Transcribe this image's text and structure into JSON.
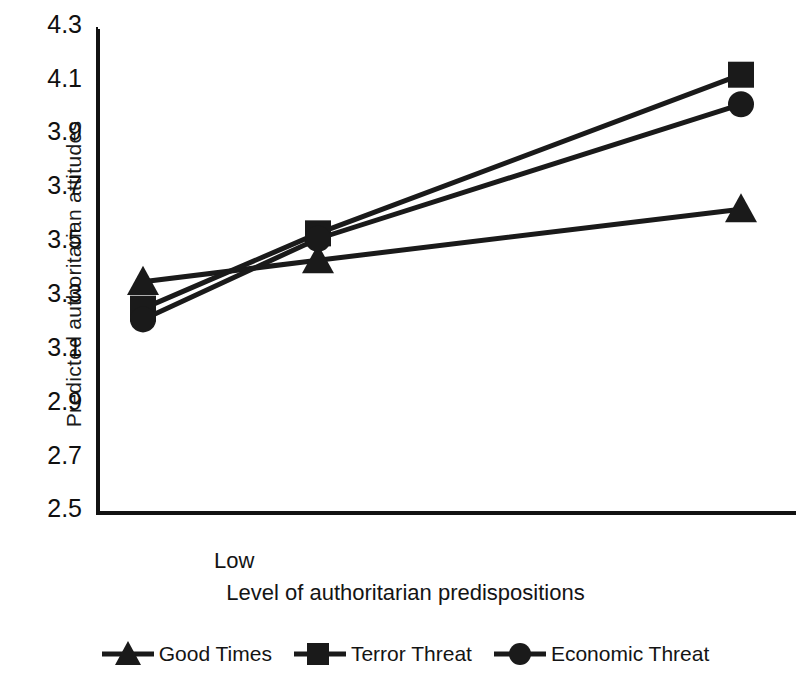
{
  "chart_data": {
    "type": "line",
    "title": "",
    "xlabel": "Level of authoritarian predispositions",
    "ylabel": "Predicted authoritarian attitudes",
    "categories": [
      "Low",
      "Medium",
      "High"
    ],
    "x_tick_labels": [
      "Low",
      "High"
    ],
    "y_tick_labels": [
      "4.3",
      "4.1",
      "3.9",
      "3.7",
      "3.5",
      "3.3",
      "3.1",
      "2.9",
      "2.7",
      "2.5"
    ],
    "y_tick_values": [
      4.3,
      4.1,
      3.9,
      3.7,
      3.5,
      3.3,
      3.1,
      2.9,
      2.7,
      2.5
    ],
    "ylim": [
      2.5,
      4.3
    ],
    "xlim": [
      0,
      2
    ],
    "grid": false,
    "legend_position": "bottom",
    "series": [
      {
        "name": "Good Times",
        "marker": "triangle",
        "color": "#1a1a1a",
        "x": [
          0,
          1,
          2
        ],
        "values": [
          3.36,
          3.44,
          3.63
        ]
      },
      {
        "name": "Terror Threat",
        "marker": "square",
        "color": "#1a1a1a",
        "x": [
          0,
          1,
          2
        ],
        "values": [
          3.26,
          3.54,
          4.13
        ]
      },
      {
        "name": "Economic Threat",
        "marker": "circle",
        "color": "#1a1a1a",
        "x": [
          0,
          1,
          2
        ],
        "values": [
          3.22,
          3.52,
          4.02
        ]
      }
    ]
  },
  "axes": {
    "y_title": "Predicted authoritarian attitudes",
    "x_title": "Level of authoritarian predispositions",
    "y_labels": [
      "4.3",
      "4.1",
      "3.9",
      "3.7",
      "3.5",
      "3.3",
      "3.1",
      "2.9",
      "2.7",
      "2.5"
    ],
    "x_label_low": "Low",
    "x_label_high": "High"
  },
  "legend": {
    "items": [
      {
        "label": "Good Times",
        "marker": "triangle-marker"
      },
      {
        "label": "Terror Threat",
        "marker": "square-marker"
      },
      {
        "label": "Economic Threat",
        "marker": "circle-marker"
      }
    ]
  },
  "style": {
    "axis_color": "#121212",
    "series_color": "#1a1a1a",
    "background": "#ffffff"
  }
}
